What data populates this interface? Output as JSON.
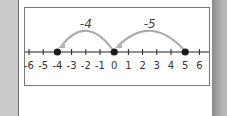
{
  "number_line": {
    "min": -6,
    "max": 6,
    "tick_labels": [
      "-6",
      "-5",
      "-4",
      "-3",
      "-2",
      "-1",
      "0",
      "1",
      "2",
      "3",
      "4",
      "5",
      "6"
    ],
    "points": [
      -4,
      0,
      5
    ],
    "jumps": [
      {
        "from": 5,
        "to": 0,
        "label": "-5"
      },
      {
        "from": 0,
        "to": -4,
        "label": "-4"
      }
    ]
  },
  "colors": {
    "line": "#222222",
    "dot": "#1a1a1a",
    "arc": "#a8a8a8",
    "arrowhead": "#b5b5b5",
    "border": "#777777"
  }
}
